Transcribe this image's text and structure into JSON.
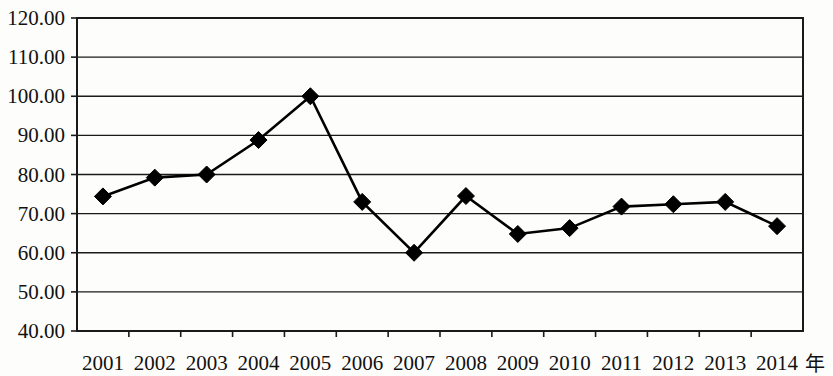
{
  "chart_data": {
    "type": "line",
    "title": "",
    "subtitle": "",
    "xlabel": "年",
    "ylabel": "",
    "categories": [
      "2001",
      "2002",
      "2003",
      "2004",
      "2005",
      "2006",
      "2007",
      "2008",
      "2009",
      "2010",
      "2011",
      "2012",
      "2013",
      "2014"
    ],
    "values": [
      74.4,
      79.2,
      80.0,
      88.8,
      100.0,
      73.0,
      60.0,
      74.5,
      64.8,
      66.3,
      71.8,
      72.4,
      73.0,
      66.8
    ],
    "series": [
      {
        "name": "",
        "values": [
          74.4,
          79.2,
          80.0,
          88.8,
          100.0,
          73.0,
          60.0,
          74.5,
          64.8,
          66.3,
          71.8,
          72.4,
          73.0,
          66.8
        ],
        "color": "#000000",
        "marker": "diamond"
      }
    ],
    "ylim": [
      40.0,
      120.0
    ],
    "ytick_values": [
      40.0,
      50.0,
      60.0,
      70.0,
      80.0,
      90.0,
      100.0,
      110.0,
      120.0
    ],
    "ytick_labels": [
      "40.00",
      "50.00",
      "60.00",
      "70.00",
      "80.00",
      "90.00",
      "100.00",
      "110.00",
      "120.00"
    ],
    "grid": true,
    "grid_axis": "y",
    "legend": false,
    "legend_position": "none",
    "line_color": "#000000",
    "background_color": "#fdfdfb",
    "axis_color": "#1a1a1a"
  }
}
